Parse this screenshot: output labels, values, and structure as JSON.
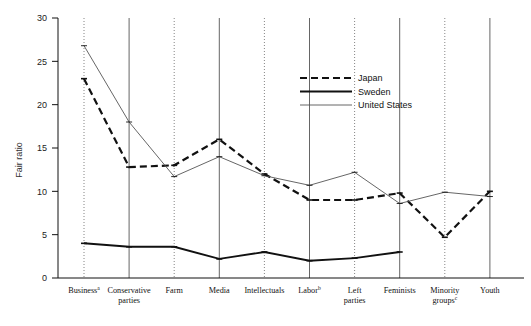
{
  "chart_data": {
    "type": "line",
    "title": "",
    "xlabel": "",
    "ylabel": "Fair ratio",
    "ylim": [
      0,
      30
    ],
    "yticks": [
      0,
      5,
      10,
      15,
      20,
      25,
      30
    ],
    "grid": "vertical-only",
    "legend_position": "upper-right",
    "categories": [
      "Business",
      "Conservative parties",
      "Farm",
      "Media",
      "Intellectuals",
      "Labor",
      "Left parties",
      "Feminists",
      "Minority groups",
      "Youth"
    ],
    "category_labels": [
      {
        "line1": "Business",
        "line2": "",
        "sup": "a"
      },
      {
        "line1": "Conservative",
        "line2": "parties",
        "sup": ""
      },
      {
        "line1": "Farm",
        "line2": "",
        "sup": ""
      },
      {
        "line1": "Media",
        "line2": "",
        "sup": ""
      },
      {
        "line1": "Intellectuals",
        "line2": "",
        "sup": ""
      },
      {
        "line1": "Labor",
        "line2": "",
        "sup": "b"
      },
      {
        "line1": "Left",
        "line2": "parties",
        "sup": ""
      },
      {
        "line1": "Feminists",
        "line2": "",
        "sup": ""
      },
      {
        "line1": "Minority",
        "line2": "groups",
        "sup": "c"
      },
      {
        "line1": "Youth",
        "line2": "",
        "sup": ""
      }
    ],
    "series": [
      {
        "name": "Japan",
        "style": "dashed",
        "color": "#111111",
        "values": [
          23.0,
          12.8,
          13.0,
          16.0,
          12.0,
          9.0,
          9.0,
          9.8,
          4.7,
          10.0
        ]
      },
      {
        "name": "Sweden",
        "style": "solid-thick",
        "color": "#111111",
        "values": [
          4.0,
          3.6,
          3.6,
          2.2,
          3.0,
          2.0,
          2.3,
          3.0,
          null,
          null
        ]
      },
      {
        "name": "United States",
        "style": "solid-thin",
        "color": "#555555",
        "values": [
          26.8,
          18.0,
          11.7,
          14.0,
          11.8,
          10.7,
          12.2,
          8.6,
          9.9,
          9.4
        ]
      }
    ]
  },
  "legend": {
    "items": [
      {
        "label": "Japan"
      },
      {
        "label": "Sweden"
      },
      {
        "label": "United States"
      }
    ]
  },
  "axis": {
    "y_title": "Fair ratio"
  }
}
